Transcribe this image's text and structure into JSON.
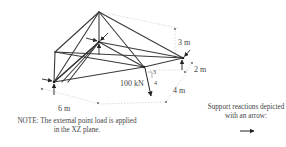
{
  "diagram": {
    "type": "space-truss",
    "colors": {
      "member": "#3a3a3a",
      "dimension": "#cfcfcf",
      "arrow": "#222222",
      "text": "#444444"
    },
    "dimensions": {
      "height": "3 m",
      "depth_offset": "2 m",
      "depth": "4 m",
      "width": "6 m"
    },
    "load": {
      "label": "100 kN",
      "slope_rise": "3",
      "slope_run": "4"
    },
    "notes": {
      "load_note_line1": "NOTE: The external point load is applied",
      "load_note_line2": "in the XZ plane.",
      "support_note_line1": "Support reactions depicted",
      "support_note_line2": "with an arrow:"
    },
    "icons": [
      "reaction-arrow-icon"
    ]
  }
}
